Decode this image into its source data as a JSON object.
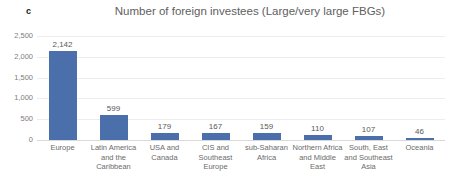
{
  "panel": {
    "letter": "c"
  },
  "chart_data": {
    "type": "bar",
    "title": "Number of foreign investees (Large/very large FBGs)",
    "xlabel": "",
    "ylabel": "",
    "ylim": [
      0,
      2500
    ],
    "grid": true,
    "legend": false,
    "orientation": "vertical",
    "bar_color": "#4a6fab",
    "categories": [
      "Europe",
      "Latin America and the Caribbean",
      "USA and Canada",
      "CIS and Southeast Europe",
      "sub-Saharan Africa",
      "Northern Africa and Middle East",
      "South, East and Southeast Asia",
      "Oceania"
    ],
    "values": [
      2142,
      599,
      179,
      167,
      159,
      110,
      107,
      46
    ],
    "value_labels": [
      "2,142",
      "599",
      "179",
      "167",
      "159",
      "110",
      "107",
      "46"
    ],
    "yticks": [
      0,
      500,
      1000,
      1500,
      2000,
      2500
    ],
    "ytick_labels": [
      "0",
      "500",
      "1,000",
      "1,500",
      "2,000",
      "2,500"
    ]
  }
}
